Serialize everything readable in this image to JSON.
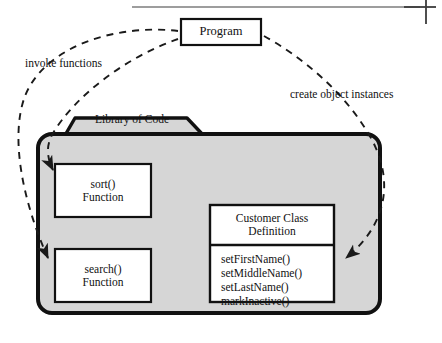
{
  "diagram": {
    "title_area": {
      "rule_present": true,
      "crop_mark_present": true
    },
    "program_box": {
      "label": "Program"
    },
    "library": {
      "tab_label": "Library of Code",
      "fill_color": "#d6d6d6",
      "border_color": "#000000"
    },
    "relations": [
      {
        "name": "invoke-functions",
        "label": "invoke functions",
        "from": "Program",
        "to": "sort() Function, search() Function",
        "style": "dashed"
      },
      {
        "name": "create-object-instances",
        "label": "create object instances",
        "from": "Program",
        "to": "Customer Class Definition",
        "style": "dashed"
      }
    ],
    "sort_box": {
      "line1": "sort()",
      "line2": "Function"
    },
    "search_box": {
      "line1": "search()",
      "line2": "Function"
    },
    "customer_class": {
      "title_line1": "Customer Class",
      "title_line2": "Definition",
      "methods": [
        "setFirstName()",
        "setMiddleName()",
        "setLastName()",
        "markInactive()"
      ]
    }
  }
}
